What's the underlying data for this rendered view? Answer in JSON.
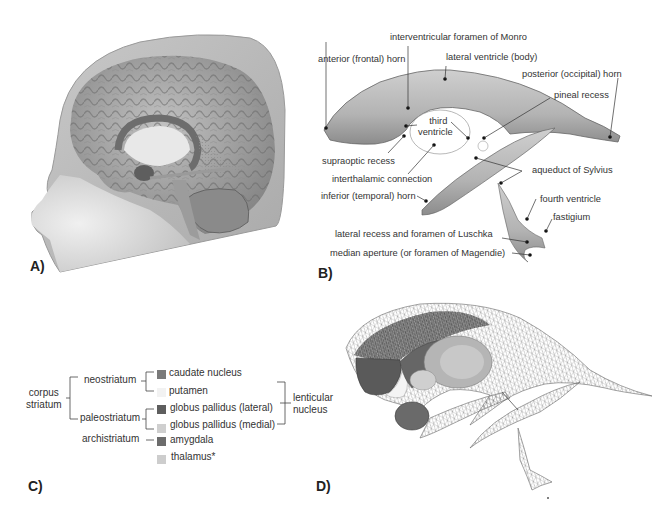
{
  "figure": {
    "panels": [
      {
        "id": "A",
        "label": "A)",
        "description": "3D rendering of head with brain cutaway showing ventricles and deep structures"
      },
      {
        "id": "B",
        "label": "B)",
        "description": "Ventricular system with labeled anatomy"
      },
      {
        "id": "C",
        "label": "C)",
        "description": "Basal ganglia classification legend"
      },
      {
        "id": "D",
        "label": "D)",
        "description": "Wireframe ventricles with basal ganglia structures"
      }
    ]
  },
  "panelB": {
    "labels": {
      "interventricular": "interventricular foramen of Monro",
      "anterior_horn": "anterior (frontal) horn",
      "lateral_body": "lateral ventricle (body)",
      "posterior_horn": "posterior (occipital) horn",
      "pineal": "pineal recess",
      "third_ventricle_1": "third",
      "third_ventricle_2": "ventricle",
      "supraoptic": "supraoptic recess",
      "interthalamic": "interthalamic connection",
      "aqueduct": "aqueduct of Sylvius",
      "inferior_horn": "inferior (temporal) horn",
      "fourth_ventricle": "fourth ventricle",
      "fastigium": "fastigium",
      "luschka": "lateral recess and foramen of Luschka",
      "magendie": "median aperture (or foramen of Magendie)"
    }
  },
  "panelC": {
    "group_corpus_1": "corpus",
    "group_corpus_2": "striatum",
    "neostriatum": "neostriatum",
    "paleostriatum": "paleostriatum",
    "archistriatum": "archistriatum",
    "lenticular_1": "lenticular",
    "lenticular_2": "nucleus",
    "items": [
      {
        "label": "caudate nucleus",
        "color": "#7a7a7a"
      },
      {
        "label": "putamen",
        "color": "#f2f2f2"
      },
      {
        "label": "globus pallidus (lateral)",
        "color": "#5e5e5e"
      },
      {
        "label": "globus pallidus (medial)",
        "color": "#cfcfcf"
      },
      {
        "label": "amygdala",
        "color": "#6c6c6c"
      },
      {
        "label": "thalamus*",
        "color": "#cdcdcd"
      }
    ]
  },
  "colors": {
    "skin": "#bdbdbd",
    "skin_light": "#d8d8d8",
    "brain": "#a9a9a9",
    "brain_dark": "#6d6d6d",
    "ventricle": "#b5b5b5",
    "ventricle_dark": "#8a8a8a",
    "mesh": "#777777"
  }
}
